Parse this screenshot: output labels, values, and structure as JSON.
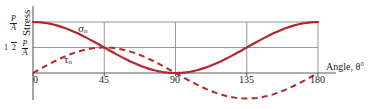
{
  "chart_data": {
    "type": "line",
    "title": "",
    "xlabel": "Angle, θ°",
    "ylabel": "Stress",
    "xlim": [
      0,
      180
    ],
    "ylim": [
      -0.55,
      1.08
    ],
    "grid": true,
    "legend": "inline-annotations",
    "xticks": [
      0,
      45,
      90,
      135,
      180
    ],
    "xticklabels": [
      "0",
      "45",
      "90",
      "135",
      "180"
    ],
    "yticks": [
      1.0,
      0.5
    ],
    "yticklabels": [
      "P/A",
      "1/2 P/A"
    ],
    "series": [
      {
        "name": "σn",
        "label": "σ",
        "sublabel": "n",
        "style": "solid",
        "color": "#b5262c",
        "formula": "cos^2(theta)",
        "x": [
          0,
          15,
          30,
          45,
          60,
          75,
          90,
          105,
          120,
          135,
          150,
          165,
          180
        ],
        "values": [
          1.0,
          0.933,
          0.75,
          0.5,
          0.25,
          0.067,
          0.0,
          0.067,
          0.25,
          0.5,
          0.75,
          0.933,
          1.0
        ]
      },
      {
        "name": "τn",
        "label": "τ",
        "sublabel": "n",
        "style": "dashed",
        "color": "#b5262c",
        "formula": "sin(theta)cos(theta)",
        "x": [
          0,
          15,
          30,
          45,
          60,
          75,
          90,
          105,
          120,
          135,
          150,
          165,
          180
        ],
        "values": [
          0.0,
          0.25,
          0.433,
          0.5,
          0.433,
          0.25,
          0.0,
          -0.25,
          -0.433,
          -0.5,
          -0.433,
          -0.25,
          0.0
        ]
      }
    ]
  },
  "axes": {
    "y_label": "Stress",
    "y_tick_top": {
      "coef": "",
      "numerator": "P",
      "denominator": "A"
    },
    "y_tick_half": {
      "coef": "1/2",
      "coef_num": "1",
      "coef_den": "2",
      "numerator": "P",
      "denominator": "A"
    },
    "x_label": "Angle, θ°",
    "x_ticks": [
      "0",
      "45",
      "90",
      "135",
      "180"
    ]
  },
  "annotations": {
    "sigma": {
      "symbol": "σ",
      "sub": "n"
    },
    "tau": {
      "symbol": "τ",
      "sub": "n"
    }
  },
  "colors": {
    "curve": "#b5262c",
    "grid": "#8c8c8c",
    "axis": "#5a5a5a",
    "text": "#1b1b1b",
    "background": "#ffffff"
  }
}
